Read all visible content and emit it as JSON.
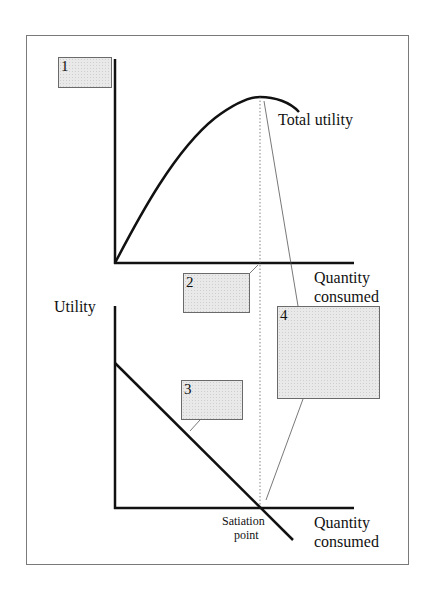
{
  "diagram": {
    "upper_graph": {
      "curve_label": "Total utility",
      "x_axis_label_line1": "Quantity",
      "x_axis_label_line2": "consumed"
    },
    "lower_graph": {
      "y_axis_label": "Utility",
      "x_axis_label_line1": "Quantity",
      "x_axis_label_line2": "consumed",
      "satiation_label_line1": "Satiation",
      "satiation_label_line2": "point"
    },
    "blank_boxes": [
      {
        "number": "1",
        "role": "upper graph y-axis label placeholder"
      },
      {
        "number": "2",
        "role": "upper graph x-axis placeholder"
      },
      {
        "number": "3",
        "role": "lower graph line label placeholder"
      },
      {
        "number": "4",
        "role": "peak / satiation explanation placeholder"
      }
    ],
    "colors": {
      "axis": "#111111",
      "curve": "#111111",
      "leader_line": "#555555",
      "dotted_guide": "#666666",
      "box_fill": "#e9e9e9",
      "frame": "#7a7a7a"
    }
  }
}
